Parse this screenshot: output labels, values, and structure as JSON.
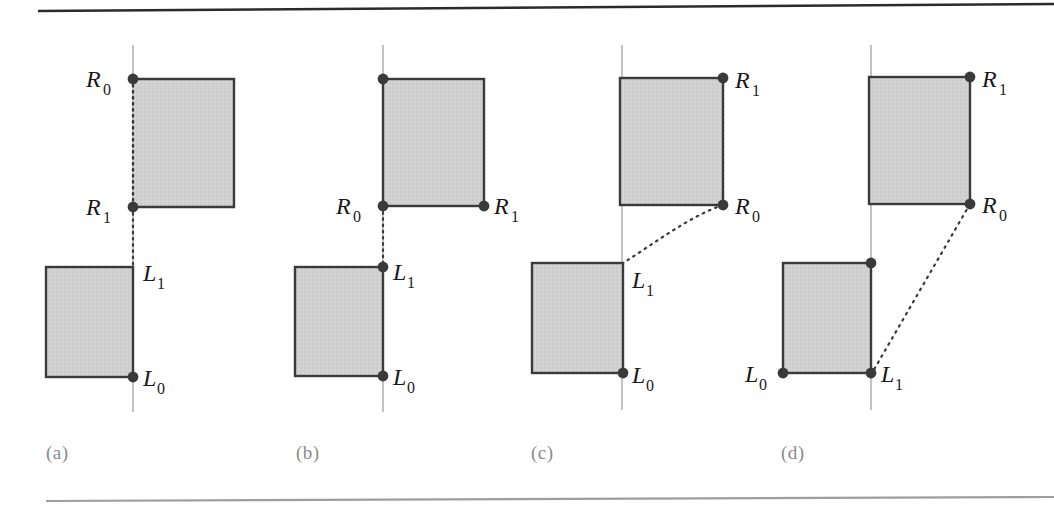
{
  "figure": {
    "title": "",
    "background_color": "#ffffff",
    "rule_color": "#2b2b2b",
    "fill_color": "#cfcfcf",
    "stroke_color": "#3a3a3a",
    "axis_color": "#9a9a9a",
    "dot_color": "#3a3a3a",
    "label_color": "#1a1a1a",
    "caption_color": "#8b8b8b"
  },
  "panels": [
    {
      "id": "a",
      "caption": "(a)",
      "labels": {
        "upper_left_top": "R_0",
        "upper_left_bottom": "R_1",
        "lower_right_top": "L_1",
        "lower_right_bottom": "L_0"
      },
      "label_texts": [
        "R",
        "0",
        "R",
        "1",
        "L",
        "1",
        "L",
        "0"
      ]
    },
    {
      "id": "b",
      "caption": "(b)",
      "labels": {
        "upper_left_bottom": "R_0",
        "upper_right_bottom": "R_1",
        "lower_right_top": "L_1",
        "lower_right_bottom": "L_0"
      },
      "label_texts": [
        "R",
        "0",
        "R",
        "1",
        "L",
        "1",
        "L",
        "0"
      ]
    },
    {
      "id": "c",
      "caption": "(c)",
      "labels": {
        "upper_right_top": "R_1",
        "upper_right_bottom": "R_0",
        "lower_right_top": "L_1",
        "lower_right_bottom": "L_0"
      },
      "label_texts": [
        "R",
        "1",
        "R",
        "0",
        "L",
        "1",
        "L",
        "0"
      ]
    },
    {
      "id": "d",
      "caption": "(d)",
      "labels": {
        "upper_right_top": "R_1",
        "upper_right_bottom": "R_0",
        "lower_left_bottom": "L_0",
        "lower_right_bottom": "L_1"
      },
      "label_texts": [
        "R",
        "1",
        "R",
        "0",
        "L",
        "0",
        "L",
        "1"
      ]
    }
  ],
  "text": {
    "R": "R",
    "L": "L",
    "sub0": "0",
    "sub1": "1",
    "caption_a": "(a)",
    "caption_b": "(b)",
    "caption_c": "(c)",
    "caption_d": "(d)"
  }
}
